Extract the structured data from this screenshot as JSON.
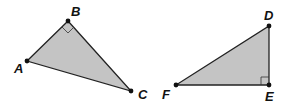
{
  "figure": {
    "fill_color": "#c4c4c4",
    "stroke_color": "#222222",
    "triangle1": {
      "vertices": {
        "A": [
          27,
          61
        ],
        "B": [
          68,
          21
        ],
        "C": [
          131,
          91
        ]
      },
      "right_angle_at": "B",
      "labels": {
        "A": "A",
        "B": "B",
        "C": "C"
      }
    },
    "triangle2": {
      "vertices": {
        "D": [
          269,
          26
        ],
        "E": [
          269,
          85
        ],
        "F": [
          176,
          85
        ]
      },
      "right_angle_at": "E",
      "labels": {
        "D": "D",
        "E": "E",
        "F": "F"
      }
    }
  }
}
